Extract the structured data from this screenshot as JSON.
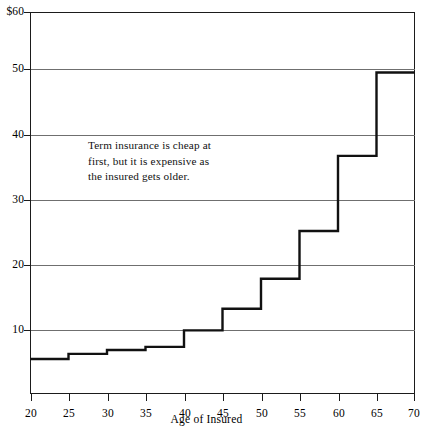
{
  "chart_data": {
    "type": "line",
    "subtype": "step",
    "title": "",
    "xlabel": "Age of Insured",
    "ylabel": "",
    "xlim": [
      20,
      70
    ],
    "ylim": [
      0,
      60
    ],
    "grid": true,
    "legend": null,
    "x_ticks": [
      20,
      25,
      30,
      35,
      40,
      45,
      50,
      55,
      60,
      65,
      70
    ],
    "x_tick_labels": [
      "20",
      "25",
      "30",
      "35",
      "40",
      "45",
      "50",
      "55",
      "60",
      "65",
      "70"
    ],
    "y_ticks": [
      10,
      20,
      30,
      40,
      50,
      60
    ],
    "y_tick_labels": [
      "10",
      "20",
      "30",
      "40",
      "50",
      "$60"
    ],
    "y_axis_prefix": "$",
    "series": [
      {
        "name": "Term insurance annual premium",
        "style": "step",
        "color": "#111111",
        "line_width": 2.4,
        "steps": [
          {
            "x_start": 20,
            "x_end": 25,
            "value": 5.5
          },
          {
            "x_start": 25,
            "x_end": 30,
            "value": 6.3
          },
          {
            "x_start": 30,
            "x_end": 35,
            "value": 6.9
          },
          {
            "x_start": 35,
            "x_end": 40,
            "value": 7.4
          },
          {
            "x_start": 40,
            "x_end": 45,
            "value": 10.0
          },
          {
            "x_start": 45,
            "x_end": 50,
            "value": 13.4
          },
          {
            "x_start": 50,
            "x_end": 55,
            "value": 18.1
          },
          {
            "x_start": 55,
            "x_end": 60,
            "value": 25.6
          },
          {
            "x_start": 60,
            "x_end": 65,
            "value": 37.4
          },
          {
            "x_start": 65,
            "x_end": 70,
            "value": 50.5
          }
        ]
      }
    ],
    "annotations": [
      {
        "name": "term-insurance-note",
        "lines": [
          "Term insurance is cheap at",
          "first, but it is expensive as",
          "the insured gets older."
        ],
        "x": 26,
        "y": 38
      }
    ],
    "colors": {
      "series_line": "#111111",
      "gridline": "#6f6f6f",
      "frame": "#1b1b1b",
      "background": "#ffffff",
      "text": "#000000"
    }
  }
}
